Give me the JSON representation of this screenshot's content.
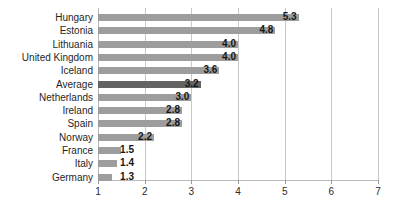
{
  "chart_data": {
    "type": "bar",
    "orientation": "horizontal",
    "title": "",
    "subtitle": "",
    "xlabel": "",
    "ylabel": "",
    "xlim": [
      1,
      7
    ],
    "xticks": [
      1,
      2,
      3,
      4,
      5,
      6,
      7
    ],
    "xtick_labels": [
      "1",
      "2",
      "3",
      "4",
      "5",
      "6",
      "7"
    ],
    "grid": true,
    "grid_axis": "x",
    "legend": false,
    "legend_position": "none",
    "bar_base_value": 1,
    "categories": [
      "Hungary",
      "Estonia",
      "Lithuania",
      "United Kingdom",
      "Iceland",
      "Average",
      "Netherlands",
      "Ireland",
      "Spain",
      "Norway",
      "France",
      "Italy",
      "Germany"
    ],
    "values": [
      5.3,
      4.8,
      4.0,
      4.0,
      3.6,
      3.2,
      3.0,
      2.8,
      2.8,
      2.2,
      1.5,
      1.4,
      1.3
    ],
    "value_labels": [
      "5.3",
      "4.8",
      "4.0",
      "4.0",
      "3.6",
      "3.2",
      "3.0",
      "2.8",
      "2.8",
      "2.2",
      "1.5",
      "1.4",
      "1.3"
    ],
    "highlight_category": "Average",
    "colors": {
      "bar": "#9d9d9d",
      "bar_highlight": "#636363",
      "gridline": "#c9c9c9",
      "axis": "#b8b8b8",
      "text": "#1f1f1f",
      "background": "#ffffff"
    }
  }
}
